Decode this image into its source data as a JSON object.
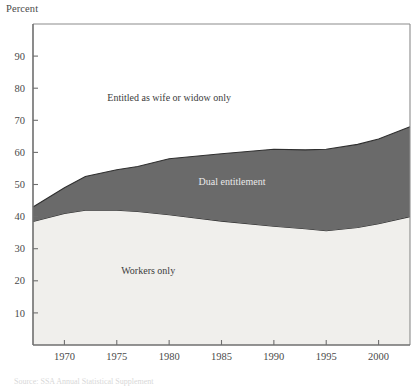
{
  "figure": {
    "y_axis_title": "Percent",
    "footnote": "Source: SSA Annual Statistical Supplement"
  },
  "chart_data": {
    "type": "area",
    "title": "",
    "subtitle": "",
    "xlabel": "",
    "ylabel": "Percent",
    "stacked": true,
    "grid": false,
    "legend_position": "inline-annotations",
    "xlim": [
      1967,
      2003
    ],
    "ylim": [
      0,
      100
    ],
    "xticks": [
      1970,
      1975,
      1980,
      1985,
      1990,
      1995,
      2000
    ],
    "yticks": [
      10,
      20,
      30,
      40,
      50,
      60,
      70,
      80,
      90
    ],
    "x": [
      1967,
      1970,
      1972,
      1975,
      1977,
      1980,
      1985,
      1990,
      1993,
      1995,
      1998,
      2000,
      2003
    ],
    "series": [
      {
        "name": "Workers only",
        "color": "#f0efec",
        "values": [
          38.5,
          41.0,
          42.0,
          42.0,
          41.6,
          40.6,
          38.6,
          37.0,
          36.2,
          35.6,
          36.6,
          37.8,
          40.0
        ]
      },
      {
        "name": "Dual entitlement",
        "color": "#6a6a6a",
        "values": [
          4.5,
          8.0,
          10.5,
          12.6,
          14.0,
          17.4,
          21.0,
          24.0,
          24.6,
          25.4,
          25.9,
          26.4,
          28.0
        ]
      },
      {
        "name": "Entitled as wife or widow only",
        "color": "#ffffff",
        "values": [
          57.0,
          51.0,
          47.5,
          45.4,
          44.4,
          42.0,
          40.4,
          39.0,
          39.2,
          39.0,
          37.5,
          35.8,
          32.0
        ]
      }
    ],
    "cumulative_upper_workers": [
      38.5,
      41.0,
      42.0,
      42.0,
      41.6,
      40.6,
      38.6,
      37.0,
      36.2,
      35.6,
      36.6,
      37.8,
      40.0
    ],
    "cumulative_upper_dual": [
      43.0,
      49.0,
      52.5,
      54.6,
      55.6,
      58.0,
      59.6,
      61.0,
      60.8,
      61.0,
      62.5,
      64.2,
      68.0
    ],
    "annotations": [
      {
        "text": "Entitled as wife or widow only",
        "x": 1980,
        "y": 76,
        "on_dark": false
      },
      {
        "text": "Dual entitlement",
        "x": 1986,
        "y": 50,
        "on_dark": true
      },
      {
        "text": "Workers only",
        "x": 1978,
        "y": 22,
        "on_dark": false
      }
    ]
  }
}
